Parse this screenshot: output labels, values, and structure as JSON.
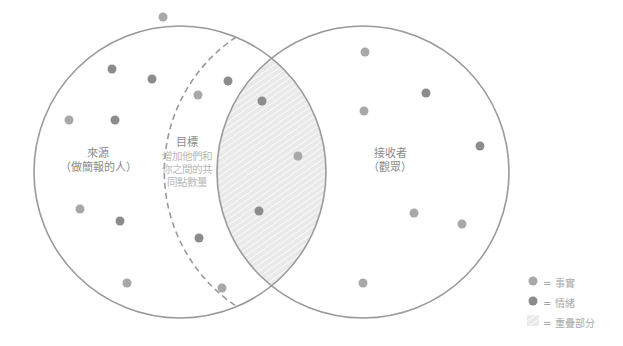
{
  "labels": {
    "source_title": "來源",
    "source_sub": "（做簡報的人）",
    "goal_title": "目標",
    "goal_desc_1": "增加他們和",
    "goal_desc_2": "你之間的共",
    "goal_desc_3": "同點數量",
    "receiver_title": "接收者",
    "receiver_sub": "（觀眾）"
  },
  "legend": {
    "fact": "= 事實",
    "emotion": "= 情緒",
    "overlap": "= 重疊部分"
  },
  "colors": {
    "circle_stroke": "#9a9a9a",
    "fact_dot": "#a8a8a8",
    "emotion_dot": "#8c8c8c",
    "hatch_bg": "#ececec",
    "hatch_line": "#ffffff"
  },
  "dots": {
    "fact": [
      [
        163,
        17
      ],
      [
        198,
        95
      ],
      [
        69,
        120
      ],
      [
        365,
        52
      ],
      [
        364,
        111
      ],
      [
        298,
        156
      ],
      [
        414,
        213
      ],
      [
        462,
        224
      ],
      [
        363,
        283
      ],
      [
        127,
        283
      ],
      [
        222,
        288
      ],
      [
        80,
        209
      ]
    ],
    "emotion": [
      [
        112,
        69
      ],
      [
        152,
        79
      ],
      [
        228,
        81
      ],
      [
        115,
        120
      ],
      [
        262,
        101
      ],
      [
        426,
        93
      ],
      [
        480,
        146
      ],
      [
        259,
        211
      ],
      [
        120,
        221
      ],
      [
        199,
        238
      ]
    ]
  }
}
